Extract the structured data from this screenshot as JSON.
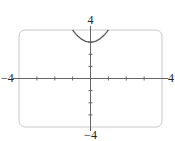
{
  "chart_data": {
    "type": "line",
    "title": "",
    "xlabel": "",
    "ylabel": "",
    "xlim": [
      -4,
      4
    ],
    "ylim": [
      -4,
      4
    ],
    "x_tick_step": 1,
    "y_tick_step": 1,
    "grid": false,
    "range_labels": {
      "xmin": "−4",
      "xmax": "4",
      "ymin": "−4",
      "ymax": "4"
    },
    "series": [
      {
        "name": "y = x^2 + 3",
        "x": [
          -1,
          -0.75,
          -0.5,
          -0.25,
          0,
          0.25,
          0.5,
          0.75,
          1
        ],
        "y": [
          4,
          3.5625,
          3.25,
          3.0625,
          3,
          3.0625,
          3.25,
          3.5625,
          4
        ],
        "color": "#555555"
      }
    ]
  }
}
